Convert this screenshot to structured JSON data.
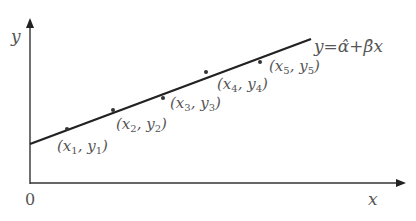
{
  "diagram": {
    "axes": {
      "x_label": "x",
      "y_label": "y",
      "origin_label": "0"
    },
    "regression_line": {
      "label_parts": [
        "y",
        "=",
        "α̂",
        "+",
        "β̂",
        "x"
      ],
      "equation": "y = α̂ + β̂x"
    },
    "points": [
      {
        "label": "(x₁, y₁)",
        "x_sym": "x",
        "x_sub": "1",
        "y_sym": "y",
        "y_sub": "1"
      },
      {
        "label": "(x₂, y₂)",
        "x_sym": "x",
        "x_sub": "2",
        "y_sym": "y",
        "y_sub": "2"
      },
      {
        "label": "(x₃, y₃)",
        "x_sym": "x",
        "x_sub": "3",
        "y_sym": "y",
        "y_sub": "3"
      },
      {
        "label": "(x₄, y₄)",
        "x_sym": "x",
        "x_sub": "4",
        "y_sym": "y",
        "y_sub": "4"
      },
      {
        "label": "(x₅, y₅)",
        "x_sym": "x",
        "x_sub": "5",
        "y_sym": "y",
        "y_sub": "5"
      }
    ],
    "colors": {
      "line": "#222222",
      "axis": "#333333",
      "text": "#555555"
    }
  }
}
